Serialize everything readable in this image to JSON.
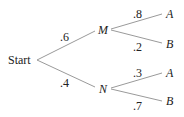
{
  "diagram": {
    "type": "probability-tree",
    "root": "Start",
    "level1": [
      {
        "node": "M",
        "prob": ".6",
        "children": [
          {
            "node": "A",
            "prob": ".8"
          },
          {
            "node": "B",
            "prob": ".2"
          }
        ]
      },
      {
        "node": "N",
        "prob": ".4",
        "children": [
          {
            "node": "A",
            "prob": ".3"
          },
          {
            "node": "B",
            "prob": ".7"
          }
        ]
      }
    ]
  }
}
